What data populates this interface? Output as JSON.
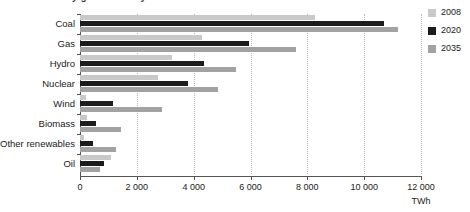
{
  "title_sliver": "World electricity generation by source",
  "chart_data": {
    "type": "bar",
    "orientation": "horizontal",
    "title": "World electricity generation by source",
    "xlabel": "TWh",
    "ylabel": "",
    "unit": "TWh",
    "xlim": [
      0,
      12000
    ],
    "xticks": [
      0,
      2000,
      4000,
      6000,
      8000,
      10000,
      12000
    ],
    "xtick_labels": [
      "0",
      "2 000",
      "4 000",
      "6 000",
      "8 000",
      "10 000",
      "12 000"
    ],
    "grid": true,
    "legend_position": "right",
    "categories": [
      "Coal",
      "Gas",
      "Hydro",
      "Nuclear",
      "Wind",
      "Biomass",
      "Other renewables",
      "Oil"
    ],
    "series": [
      {
        "name": "2008",
        "color": "#c9c9c9",
        "values": [
          8270,
          4300,
          3220,
          2730,
          220,
          260,
          150,
          1100
        ]
      },
      {
        "name": "2020",
        "color": "#1c1c1c",
        "values": [
          10700,
          5950,
          4380,
          3800,
          1150,
          560,
          450,
          850
        ]
      },
      {
        "name": "2035",
        "color": "#a2a2a2",
        "values": [
          11200,
          7600,
          5500,
          4850,
          2900,
          1430,
          1280,
          700
        ]
      }
    ]
  },
  "legend": {
    "items": [
      {
        "label": "2008",
        "color": "#c9c9c9"
      },
      {
        "label": "2020",
        "color": "#1c1c1c"
      },
      {
        "label": "2035",
        "color": "#a2a2a2"
      }
    ]
  }
}
